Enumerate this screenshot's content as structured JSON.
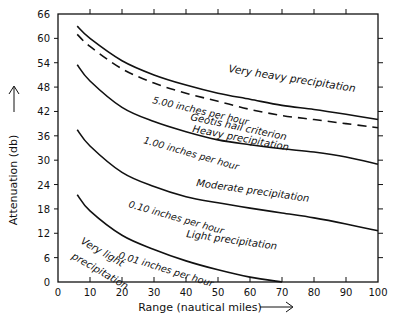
{
  "chart_data": {
    "type": "line",
    "title": "",
    "xlabel": "Range (nautical miles)",
    "ylabel": "Attenuation (db)",
    "xlim": [
      0,
      100
    ],
    "ylim": [
      0,
      66
    ],
    "x_ticks": [
      0,
      10,
      20,
      30,
      40,
      50,
      60,
      70,
      80,
      90,
      100
    ],
    "y_ticks": [
      0,
      6,
      12,
      18,
      24,
      30,
      36,
      42,
      48,
      54,
      60,
      66
    ],
    "grid": false,
    "legend": "none (inline curve labels)",
    "series": [
      {
        "name": "5.00 inches per hour",
        "style": "solid",
        "x": [
          6,
          10,
          20,
          30,
          40,
          50,
          60,
          70,
          80,
          90,
          100
        ],
        "y": [
          63,
          60,
          54.5,
          51,
          48.5,
          46.5,
          45,
          43.5,
          42.5,
          41.3,
          40
        ]
      },
      {
        "name": "Geotis hail criterion",
        "style": "dashed",
        "x": [
          6,
          10,
          20,
          30,
          40,
          50,
          60,
          70,
          80,
          90,
          100
        ],
        "y": [
          61,
          58,
          52.5,
          49,
          46.5,
          44.5,
          42.5,
          41,
          40,
          39,
          38
        ]
      },
      {
        "name": "1.00 inches per hour",
        "style": "solid",
        "x": [
          6,
          10,
          20,
          30,
          40,
          50,
          60,
          70,
          80,
          90,
          100
        ],
        "y": [
          53.5,
          49.5,
          43,
          39.5,
          37,
          35,
          33.8,
          32.8,
          32,
          30.8,
          29
        ]
      },
      {
        "name": "0.10 inches per hour",
        "style": "solid",
        "x": [
          6,
          10,
          20,
          30,
          40,
          50,
          60,
          70,
          80,
          90,
          100
        ],
        "y": [
          37.5,
          33.5,
          27,
          23.5,
          21,
          19.5,
          18.2,
          17,
          15.8,
          14.3,
          12.6
        ]
      },
      {
        "name": "0.01 inches per hour",
        "style": "solid",
        "x": [
          6,
          10,
          20,
          30,
          40,
          50,
          60,
          70
        ],
        "y": [
          21.5,
          17.5,
          11.5,
          8,
          5.2,
          3,
          1.2,
          0
        ]
      }
    ],
    "annotations": [
      {
        "text": "Very heavy precipitation",
        "x": 70,
        "y": 51
      },
      {
        "text": "Geotis hail criterion",
        "x": 60,
        "y": 41
      },
      {
        "text": "Heavy precipitation",
        "x": 61,
        "y": 37.5
      },
      {
        "text": "Moderate precipitation",
        "x": 59,
        "y": 25
      },
      {
        "text": "Light precipitation",
        "x": 57,
        "y": 10
      },
      {
        "text": "Very light precipitation",
        "x": 12,
        "y": 8
      }
    ]
  }
}
